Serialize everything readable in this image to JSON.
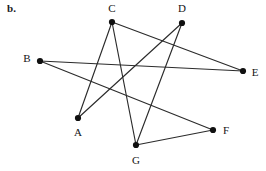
{
  "figure": {
    "label": "b.",
    "width": 266,
    "height": 171,
    "background_color": "#ffffff",
    "ink_color": "#2b2b2b",
    "vertex_color": "#101010"
  },
  "graph_data": {
    "type": "node-link-diagram",
    "directed": false,
    "vertex_count": 7,
    "edge_count": 8,
    "vertices": [
      {
        "id": "A",
        "label": "A",
        "x": 78,
        "y": 118,
        "label_x": 78,
        "label_y": 133,
        "degree": 2
      },
      {
        "id": "B",
        "label": "B",
        "x": 40,
        "y": 61,
        "label_x": 27,
        "label_y": 59,
        "degree": 2
      },
      {
        "id": "C",
        "label": "C",
        "x": 112,
        "y": 22,
        "label_x": 112,
        "label_y": 9,
        "degree": 3
      },
      {
        "id": "D",
        "label": "D",
        "x": 182,
        "y": 23,
        "label_x": 182,
        "label_y": 9,
        "degree": 2
      },
      {
        "id": "E",
        "label": "E",
        "x": 243,
        "y": 71,
        "label_x": 255,
        "label_y": 73,
        "degree": 2
      },
      {
        "id": "F",
        "label": "F",
        "x": 213,
        "y": 130,
        "label_x": 226,
        "label_y": 131,
        "degree": 2
      },
      {
        "id": "G",
        "label": "G",
        "x": 136,
        "y": 145,
        "label_x": 136,
        "label_y": 161,
        "degree": 3
      }
    ],
    "edges": [
      {
        "id": "edge-A-C",
        "from": "A",
        "to": "C"
      },
      {
        "id": "edge-A-D",
        "from": "A",
        "to": "D"
      },
      {
        "id": "edge-B-E",
        "from": "B",
        "to": "E"
      },
      {
        "id": "edge-B-F",
        "from": "B",
        "to": "F"
      },
      {
        "id": "edge-C-E",
        "from": "C",
        "to": "E"
      },
      {
        "id": "edge-C-G",
        "from": "C",
        "to": "G"
      },
      {
        "id": "edge-D-G",
        "from": "D",
        "to": "G"
      },
      {
        "id": "edge-F-G",
        "from": "F",
        "to": "G"
      }
    ]
  }
}
